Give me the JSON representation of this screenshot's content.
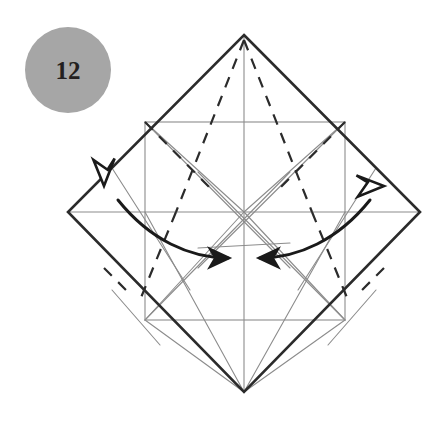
{
  "figure": {
    "kind": "origami-crease-pattern-diagram",
    "background_color": "#ffffff",
    "canvas": {
      "width": 440,
      "height": 435
    }
  },
  "step_badge": {
    "label": "12",
    "shape": "circle",
    "fill_color": "#a6a6a6",
    "text_color": "#231f20",
    "center": {
      "x": 68,
      "y": 70
    },
    "radius": 43
  },
  "outer_shape": {
    "name": "square-rotated-45",
    "stroke_color": "#2b2b2b",
    "stroke_width": 2.6,
    "vertices": {
      "top": {
        "x": 244,
        "y": 35
      },
      "right": {
        "x": 420,
        "y": 212
      },
      "bottom": {
        "x": 244,
        "y": 392
      },
      "left": {
        "x": 68,
        "y": 212
      }
    }
  },
  "inner_square": {
    "name": "inner-axis-aligned-square",
    "stroke_color": "#8c8c8c",
    "stroke_width": 1.1,
    "left": 145,
    "right": 345,
    "top": 122,
    "bottom": 320
  },
  "center_lines": {
    "stroke_color": "#8c8c8c",
    "stroke_width": 1.1,
    "horizontal": {
      "x1": 68,
      "y1": 212,
      "x2": 420,
      "y2": 212
    },
    "vertical": {
      "x1": 244,
      "y1": 35,
      "x2": 244,
      "y2": 392
    }
  },
  "valley_creases": {
    "description": "thin solid gray crease lines",
    "stroke_color": "#8c8c8c",
    "stroke_width": 1.1,
    "segments": [
      {
        "x1": 145,
        "y1": 122,
        "x2": 244,
        "y2": 212
      },
      {
        "x1": 345,
        "y1": 122,
        "x2": 244,
        "y2": 212
      },
      {
        "x1": 145,
        "y1": 320,
        "x2": 244,
        "y2": 212
      },
      {
        "x1": 345,
        "y1": 320,
        "x2": 244,
        "y2": 212
      },
      {
        "x1": 145,
        "y1": 122,
        "x2": 290,
        "y2": 268
      },
      {
        "x1": 345,
        "y1": 122,
        "x2": 198,
        "y2": 268
      },
      {
        "x1": 145,
        "y1": 320,
        "x2": 290,
        "y2": 172
      },
      {
        "x1": 345,
        "y1": 320,
        "x2": 198,
        "y2": 172
      },
      {
        "x1": 145,
        "y1": 212,
        "x2": 244,
        "y2": 392
      },
      {
        "x1": 345,
        "y1": 212,
        "x2": 244,
        "y2": 392
      },
      {
        "x1": 145,
        "y1": 320,
        "x2": 244,
        "y2": 392
      },
      {
        "x1": 345,
        "y1": 320,
        "x2": 244,
        "y2": 392
      },
      {
        "x1": 112,
        "y1": 168,
        "x2": 190,
        "y2": 290
      },
      {
        "x1": 376,
        "y1": 168,
        "x2": 298,
        "y2": 290
      },
      {
        "x1": 112,
        "y1": 290,
        "x2": 160,
        "y2": 345
      },
      {
        "x1": 376,
        "y1": 290,
        "x2": 328,
        "y2": 345
      },
      {
        "x1": 198,
        "y1": 248,
        "x2": 290,
        "y2": 243
      }
    ]
  },
  "mountain_creases": {
    "description": "dashed mountain fold lines",
    "stroke_color": "#2b2b2b",
    "stroke_width": 2.2,
    "dash_pattern": "11 9",
    "segments": [
      {
        "x1": 244,
        "y1": 40,
        "x2": 176,
        "y2": 212
      },
      {
        "x1": 244,
        "y1": 40,
        "x2": 312,
        "y2": 212
      },
      {
        "x1": 176,
        "y1": 212,
        "x2": 140,
        "y2": 300
      },
      {
        "x1": 312,
        "y1": 212,
        "x2": 348,
        "y2": 300
      },
      {
        "x1": 145,
        "y1": 122,
        "x2": 210,
        "y2": 188
      },
      {
        "x1": 345,
        "y1": 122,
        "x2": 280,
        "y2": 188
      },
      {
        "x1": 104,
        "y1": 268,
        "x2": 132,
        "y2": 296
      },
      {
        "x1": 384,
        "y1": 268,
        "x2": 356,
        "y2": 296
      }
    ]
  },
  "action_arrows": [
    {
      "name": "fold-arrow-left",
      "direction": "inward-to-center",
      "tail_head_style": "hollow-triangle",
      "tip_head_style": "solid-triangle",
      "stroke_color": "#1a1a1a",
      "stroke_width": 3.0,
      "path": "M 118 200 C 150 240 190 258 228 258",
      "hollow_head": {
        "x": 104,
        "y": 186,
        "rotation": -135
      },
      "solid_head": {
        "x": 232,
        "y": 258,
        "rotation": 6
      }
    },
    {
      "name": "fold-arrow-right",
      "direction": "inward-to-center",
      "tail_head_style": "hollow-triangle",
      "tip_head_style": "solid-triangle",
      "stroke_color": "#1a1a1a",
      "stroke_width": 3.0,
      "path": "M 370 200 C 338 240 298 258 260 258",
      "hollow_head": {
        "x": 384,
        "y": 186,
        "rotation": 135
      },
      "solid_head": {
        "x": 256,
        "y": 258,
        "rotation": 186
      }
    }
  ]
}
